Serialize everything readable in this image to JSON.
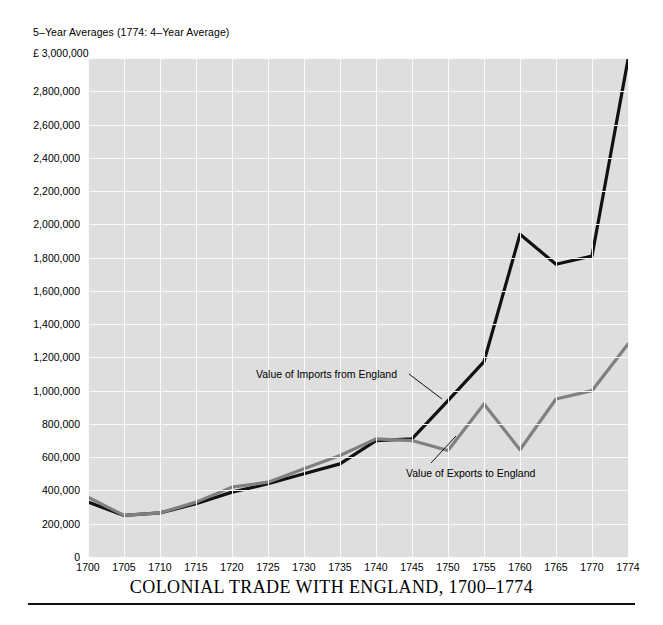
{
  "subtitle": "5–Year Averages (1774: 4–Year Average)",
  "unit_label": "£ 3,000,000",
  "title": "COLONIAL TRADE WITH ENGLAND, 1700–1774",
  "annotations": {
    "imports": "Value of Imports from England",
    "exports": "Value of Exports to England"
  },
  "colors": {
    "imports_line": "#111111",
    "exports_line": "#808080",
    "plot_background": "#dedede",
    "gridline": "#fafafa",
    "rule": "#111111"
  },
  "chart_data": {
    "type": "line",
    "title": "COLONIAL TRADE WITH ENGLAND, 1700–1774",
    "subtitle": "5–Year Averages (1774: 4–Year Average)",
    "xlabel": "",
    "ylabel": "£",
    "x": [
      1700,
      1705,
      1710,
      1715,
      1720,
      1725,
      1730,
      1735,
      1740,
      1745,
      1750,
      1755,
      1760,
      1765,
      1770,
      1774
    ],
    "xtick_labels": [
      "1700",
      "1705",
      "1710",
      "1715",
      "1720",
      "1725",
      "1730",
      "1735",
      "1740",
      "1745",
      "1750",
      "1755",
      "1760",
      "1765",
      "1770",
      "1774"
    ],
    "ytick_labels": [
      "0",
      "200,000",
      "400,000",
      "600,000",
      "800,000",
      "1,000,000",
      "1,200,000",
      "1,400,000",
      "1,600,000",
      "1,800,000",
      "2,000,000",
      "2,200,000",
      "2,400,000",
      "2,600,000",
      "2,800,000",
      "£ 3,000,000"
    ],
    "yticks": [
      0,
      200000,
      400000,
      600000,
      800000,
      1000000,
      1200000,
      1400000,
      1600000,
      1800000,
      2000000,
      2200000,
      2400000,
      2600000,
      2800000,
      3000000
    ],
    "ylim": [
      0,
      3000000
    ],
    "xlim": [
      1700,
      1774
    ],
    "grid": true,
    "legend": "annotations-on-plot",
    "series": [
      {
        "name": "Value of Imports from England",
        "color": "#111111",
        "values": [
          330000,
          250000,
          265000,
          320000,
          390000,
          440000,
          500000,
          560000,
          700000,
          710000,
          940000,
          1175000,
          1940000,
          1760000,
          1810000,
          2990000
        ]
      },
      {
        "name": "Value of Exports to England",
        "color": "#808080",
        "values": [
          360000,
          250000,
          265000,
          330000,
          420000,
          450000,
          530000,
          610000,
          710000,
          700000,
          640000,
          920000,
          645000,
          950000,
          1000000,
          1280000
        ]
      }
    ]
  }
}
